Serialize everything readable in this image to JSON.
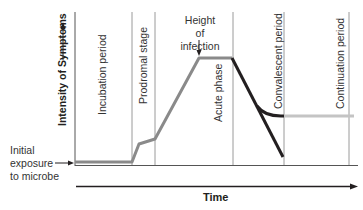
{
  "diagram": {
    "y_axis_label": "Intensity of Symptoms",
    "x_axis_label": "Time",
    "stages": [
      {
        "label": "Incubation period"
      },
      {
        "label": "Prodromal stage"
      },
      {
        "label": "Acute phase"
      },
      {
        "label": "Convalescent period"
      },
      {
        "label": "Continuation period"
      }
    ],
    "annotations": {
      "peak": "Height of infection",
      "peak_line1": "Height of",
      "peak_line2": "infection",
      "start_line1": "Initial",
      "start_line2": "exposure",
      "start_line3": "to microbe"
    },
    "colors": {
      "main_curve": "#8a8a8a",
      "decline_curve": "#231f20",
      "continuation_curve": "#c4c4c4",
      "dividers": "#9a9a9a",
      "axis": "#231f20"
    }
  }
}
